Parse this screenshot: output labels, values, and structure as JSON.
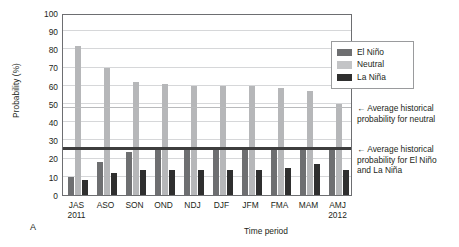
{
  "chart_data": {
    "type": "bar",
    "title": "",
    "xlabel": "Time period",
    "ylabel": "Probability (%)",
    "ylim": [
      0,
      100
    ],
    "ytick_step": 10,
    "yticks": [
      100,
      90,
      80,
      70,
      60,
      50,
      40,
      30,
      20,
      10,
      0
    ],
    "grid": true,
    "legend_position": "top-right-outside",
    "categories": [
      "JAS",
      "ASO",
      "SON",
      "OND",
      "NDJ",
      "DJF",
      "JFM",
      "FMA",
      "MAM",
      "AMJ"
    ],
    "category_year_labels": [
      "2011",
      "",
      "",
      "",
      "",
      "",
      "",
      "",
      "",
      "2012"
    ],
    "series": [
      {
        "name": "El Niño",
        "color": "#6e6f71",
        "values": [
          10,
          18,
          23.5,
          25,
          25,
          26,
          26,
          26,
          26,
          26
        ]
      },
      {
        "name": "Neutral",
        "color": "#b6b7b9",
        "values": [
          82,
          70,
          62,
          61,
          60,
          60,
          60,
          59,
          57,
          50
        ]
      },
      {
        "name": "La Niña",
        "color": "#2f2f2f",
        "values": [
          8,
          12,
          14,
          14,
          14,
          14,
          14,
          15,
          17,
          14
        ]
      }
    ],
    "reference_lines": [
      {
        "name": "average-historical-neutral",
        "value": 48,
        "style": "thin",
        "color": "#b9babc"
      },
      {
        "name": "average-historical-elnino-lanina",
        "value": 25,
        "style": "thick",
        "color": "#3d3d3d"
      }
    ],
    "annotations": [
      {
        "name": "annotation-neutral",
        "arrow": "←",
        "text": "Average historical probability for neutral"
      },
      {
        "name": "annotation-elnino-lanina",
        "arrow": "←",
        "text": "Average historical probability for El Niño and La Niña"
      }
    ],
    "panel_letter": "A"
  },
  "legend": {
    "items": [
      {
        "label": "El Niño",
        "color": "#6e6f71"
      },
      {
        "label": "Neutral",
        "color": "#c3c4c6"
      },
      {
        "label": "La Niña",
        "color": "#2f2f2f"
      }
    ]
  },
  "annotations": {
    "neutral": {
      "arrow": "←",
      "line1": "Average historical",
      "line2": "probability for neutral"
    },
    "enso": {
      "arrow": "←",
      "line1": "Average historical",
      "line2": "probability for El Niño",
      "line3": "and La Niña"
    }
  },
  "axes": {
    "ylabel": "Probability (%)",
    "xlabel": "Time period"
  },
  "panel": {
    "letter": "A"
  }
}
